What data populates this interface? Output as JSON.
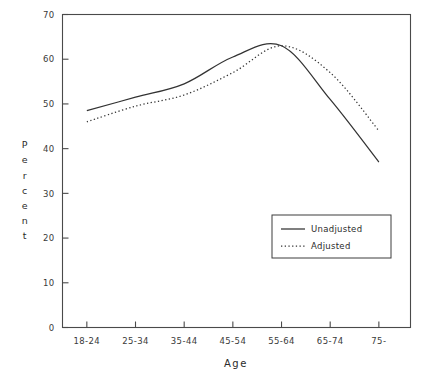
{
  "chart_data": {
    "type": "line",
    "title": "",
    "subtitle": "",
    "xlabel": "Age",
    "ylabel": "Percent",
    "categories": [
      "18-24",
      "25-34",
      "35-44",
      "45-54",
      "55-64",
      "65-74",
      "75-"
    ],
    "series": [
      {
        "name": "Unadjusted",
        "style": "solid",
        "values": [
          48.5,
          51.5,
          54.5,
          60.5,
          63,
          51,
          37
        ]
      },
      {
        "name": "Adjusted",
        "style": "dotted",
        "values": [
          46,
          49.5,
          52,
          57,
          63,
          57,
          44
        ]
      }
    ],
    "ylim": [
      0,
      70
    ],
    "yticks": [
      0,
      10,
      20,
      30,
      40,
      50,
      60,
      70
    ],
    "ytick_labels": [
      "0",
      "10",
      "20",
      "30",
      "40",
      "50",
      "60",
      "70"
    ],
    "grid": false,
    "legend_position": "lower-right",
    "legend_entries": [
      "Unadjusted",
      "Adjusted"
    ],
    "colors": {
      "line": "#333333",
      "axis": "#4a4a4a",
      "background": "#ffffff"
    }
  },
  "axes": {
    "ylabel_chars": [
      "P",
      "e",
      "r",
      "c",
      "e",
      "n",
      "t"
    ]
  }
}
